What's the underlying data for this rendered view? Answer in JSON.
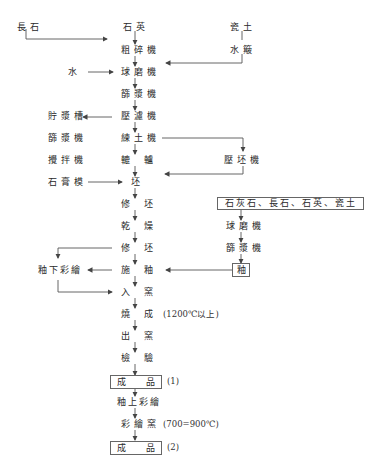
{
  "diagram": {
    "type": "process-flowchart",
    "main_flow": {
      "inputs": {
        "feldspar": "長石",
        "quartz": "石英",
        "clay": "瓷土",
        "elutriation": "水簸",
        "water": "水"
      },
      "steps": [
        {
          "id": "crusher",
          "label": "粗碎機"
        },
        {
          "id": "ball_mill",
          "label": "球磨機"
        },
        {
          "id": "sieve",
          "label": "篩漿機"
        },
        {
          "id": "filter_press",
          "label": "壓濾機"
        },
        {
          "id": "pug_mill",
          "label": "練土機"
        },
        {
          "id": "jigger",
          "label_left": "轆",
          "label_right": "轤"
        },
        {
          "id": "body",
          "label": "坯"
        },
        {
          "id": "trim1",
          "label_left": "修",
          "label_right": "坯"
        },
        {
          "id": "dry",
          "label_left": "乾",
          "label_right": "燥"
        },
        {
          "id": "trim2",
          "label_left": "修",
          "label_right": "坯"
        },
        {
          "id": "glaze",
          "label_left": "施",
          "label_right": "釉"
        },
        {
          "id": "kiln_in",
          "label_left": "入",
          "label_right": "窯"
        },
        {
          "id": "fire",
          "label_left": "燒",
          "label_right": "成"
        },
        {
          "id": "kiln_out",
          "label_left": "出",
          "label_right": "窯"
        },
        {
          "id": "inspect",
          "label_left": "檢",
          "label_right": "驗"
        },
        {
          "id": "product1",
          "label_left": "成",
          "label_right": "品",
          "tag": "(1)"
        },
        {
          "id": "overglaze",
          "label": "釉上彩繪"
        },
        {
          "id": "paint_kiln",
          "label": "彩繪窯",
          "note": "(700=900℃)"
        },
        {
          "id": "product2",
          "label_left": "成",
          "label_right": "品",
          "tag": "(2)"
        }
      ],
      "fire_note": "(1200℃以上)"
    },
    "left_branch": {
      "slurry_tank": "貯漿槽",
      "sieve2": "篩漿機",
      "mixer": "攪拌機",
      "plaster_mold": "石膏模",
      "underglaze": "釉下彩繪"
    },
    "right_branch": {
      "press_machine": "壓坯機",
      "glaze_materials": "石灰石、長石、石英、瓷土",
      "glaze_ball_mill": "球磨機",
      "glaze_sieve": "篩漿機",
      "glaze": "釉"
    },
    "colors": {
      "line": "#555555",
      "text": "#2a2a2a",
      "background": "#ffffff"
    }
  }
}
